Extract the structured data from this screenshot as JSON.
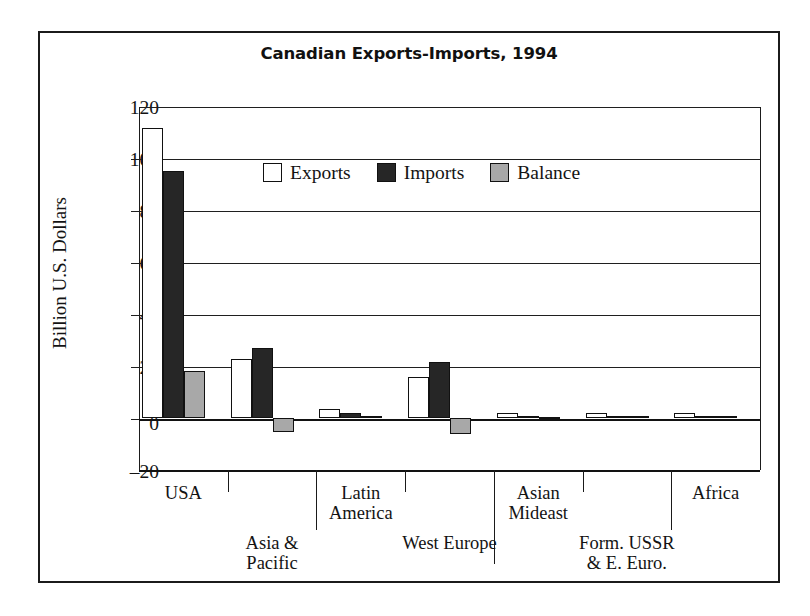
{
  "figure": {
    "title": "Canadian Exports-Imports, 1994"
  },
  "axes": {
    "ylabel": "Billion U.S. Dollars",
    "yticks": [
      "120",
      "100",
      "80",
      "60",
      "40",
      "20",
      "0",
      "–20"
    ]
  },
  "legend": {
    "entries": [
      {
        "label": "Exports",
        "swatch": "exports-swatch",
        "color": "#ffffff"
      },
      {
        "label": "Imports",
        "swatch": "imports-swatch",
        "color": "#262626"
      },
      {
        "label": "Balance",
        "swatch": "balance-swatch",
        "color": "#a8a8a8"
      }
    ]
  },
  "categories": [
    {
      "lines": [
        "USA"
      ]
    },
    {
      "lines": [
        "Asia &",
        "Pacific"
      ]
    },
    {
      "lines": [
        "Latin",
        "America"
      ]
    },
    {
      "lines": [
        "West Europe"
      ]
    },
    {
      "lines": [
        "Asian",
        "Mideast"
      ]
    },
    {
      "lines": [
        "Form. USSR",
        "& E. Euro."
      ]
    },
    {
      "lines": [
        "Africa"
      ]
    }
  ],
  "chart_data": {
    "type": "bar",
    "title": "Canadian Exports-Imports, 1994",
    "xlabel": "",
    "ylabel": "Billion U.S. Dollars",
    "ylim": [
      -20,
      120
    ],
    "ytick_step": 20,
    "grid": true,
    "grid_axis": "y",
    "legend_position": "inside-upper-center",
    "categories": [
      "USA",
      "Asia & Pacific",
      "Latin America",
      "West Europe",
      "Asian Mideast",
      "Form. USSR & E. Euro.",
      "Africa"
    ],
    "series": [
      {
        "name": "Exports",
        "color": "#ffffff",
        "values": [
          112,
          23,
          3.5,
          16,
          2,
          2,
          2
        ]
      },
      {
        "name": "Imports",
        "color": "#262626",
        "values": [
          95.5,
          27,
          2,
          21.5,
          1,
          1,
          1
        ]
      },
      {
        "name": "Balance",
        "color": "#a8a8a8",
        "values": [
          18,
          -5.5,
          1,
          -6,
          0.5,
          1,
          1
        ]
      }
    ]
  }
}
